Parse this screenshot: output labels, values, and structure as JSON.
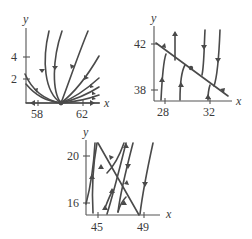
{
  "figure": {
    "panels": [
      {
        "id": "panel-1",
        "x_label": "x",
        "y_label": "y",
        "x_ticks": [
          "58",
          "62"
        ],
        "y_ticks": [
          "4",
          "2"
        ],
        "equilibrium": "x=60, y=0",
        "description": "Phase portrait with trajectories converging to an equilibrium point on the x-axis"
      },
      {
        "id": "panel-2",
        "x_label": "x",
        "y_label": "y",
        "x_ticks": [
          "28",
          "32"
        ],
        "y_ticks": [
          "42",
          "38"
        ],
        "description": "Trajectories approaching a line of equilibria sloping downward; flow along the line toward the lower right"
      },
      {
        "id": "panel-3",
        "x_label": "x",
        "y_label": "y",
        "x_ticks": [
          "45",
          "49"
        ],
        "y_ticks": [
          "20",
          "16"
        ],
        "description": "Crossing families of trajectories with a descending diagonal separatrix"
      }
    ]
  }
}
